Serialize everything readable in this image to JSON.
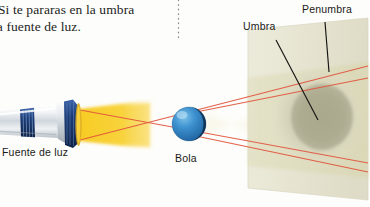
{
  "figure": {
    "kind": "optics-shadow-diagram",
    "language": "es",
    "caption": {
      "line1": "Si te pararas en la umbra",
      "line2": "la fuente de luz."
    },
    "labels": {
      "umbra": "Umbra",
      "penumbra": "Penumbra",
      "light_source": "Fuente de luz",
      "ball": "Bola"
    },
    "colors": {
      "light_beam": "#f5c518",
      "ray_lines": "#e8553c",
      "ball_lit": "#2a7fc4",
      "ball_shadow": "#10304f",
      "screen_panel": "#e9e7d3",
      "umbra_patch": "#b4b296",
      "penumbra_patch": "#d4d2ba",
      "leader_line": "#1a1a1a",
      "text": "#231f1c",
      "flashlight_body": "#e3e6e8",
      "flashlight_ring": "#1d3f7a"
    }
  }
}
